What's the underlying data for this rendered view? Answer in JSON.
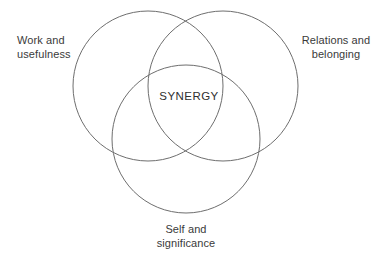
{
  "diagram": {
    "type": "venn-3-circle",
    "background_color": "#ffffff",
    "stroke_color": "#6e6e6e",
    "text_color": "#3a3a3a",
    "center_label": "SYNERGY",
    "labels": {
      "top_left": "Work and\nusefulness",
      "top_right": "Relations and\nbelonging",
      "bottom": "Self and\nsignificance"
    },
    "circles": [
      {
        "name": "work-and-usefulness-circle",
        "cx": 148,
        "cy": 86,
        "r": 75
      },
      {
        "name": "relations-and-belonging-circle",
        "cx": 223,
        "cy": 86,
        "r": 75
      },
      {
        "name": "self-and-significance-circle",
        "cx": 186,
        "cy": 139,
        "r": 74
      }
    ]
  }
}
